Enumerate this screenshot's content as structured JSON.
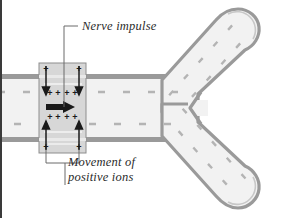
{
  "figure": {
    "labels": {
      "nerve_impulse": "Nerve impulse",
      "movement_line1": "Movement of",
      "movement_line2": "positive ions"
    },
    "ion_symbol": "+",
    "colors": {
      "membrane_outline": "#9a9a9a",
      "axon_fill": "#f2f2f2",
      "highlight_box_fill": "#d7d7d7",
      "highlight_box_stroke": "#8d8d8d",
      "interior_dash": "#b4b4b4",
      "impulse_arrow": "#1a1a1a",
      "leader_line": "#6b6b6b",
      "frame_border": "#3a3a3a",
      "text": "#2b2b2b"
    },
    "structures": {
      "axon": "axon-shaft",
      "branches": 2,
      "terminals": "synaptic-terminal-bulbs",
      "impulse_direction": "rightward"
    },
    "ion_arrows": {
      "top_direction": "downward-into-axon",
      "bottom_direction": "upward-into-axon",
      "count_top": 2,
      "count_bottom": 2
    }
  }
}
